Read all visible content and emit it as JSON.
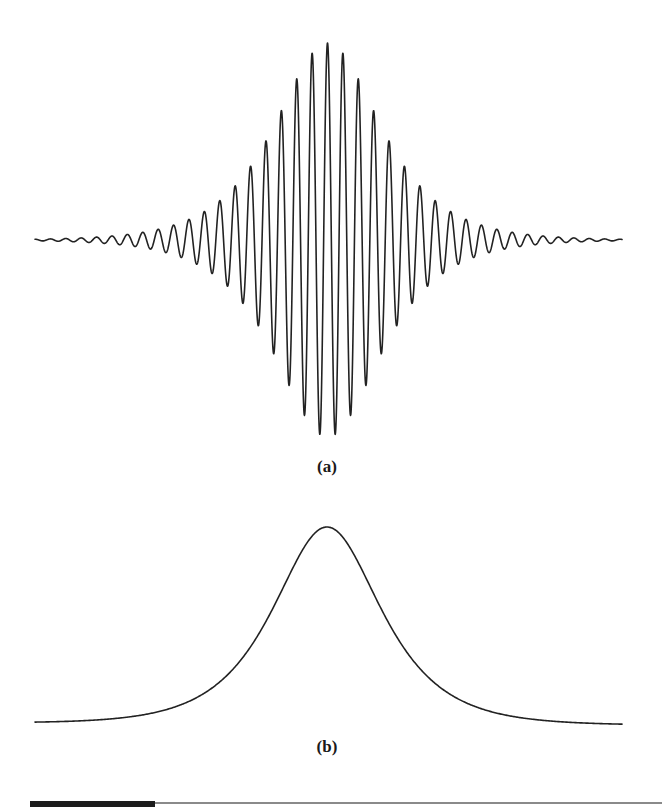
{
  "figure": {
    "panels": [
      {
        "id": "a",
        "label": "(a)"
      },
      {
        "id": "b",
        "label": "(b)"
      }
    ],
    "colors": {
      "line": "#222222",
      "background": "#ffffff",
      "rule_thick": "#1c1c1c",
      "rule_thin": "#8a8a8a"
    }
  },
  "chart_data": [
    {
      "type": "line",
      "title": "",
      "panel_label": "(a)",
      "description": "Oscillating wave packet: cosine carrier under a symmetric sech-shaped envelope, peak at center",
      "xlabel": "",
      "ylabel": "",
      "axes_visible": false,
      "grid": false,
      "legend": null,
      "model": {
        "form": "A * sech((x - x0)/w) * cos(2*pi*(x - x0)/period)",
        "x_start_px": 35,
        "x_end_px": 622,
        "x0_px": 327.5,
        "baseline_y_px": 240,
        "amplitude_px": 197,
        "period_px": 15.4,
        "envelope_width_px": 47
      },
      "peaks": {
        "offset_periods": [
          0,
          1,
          2,
          3,
          4,
          5,
          6,
          7,
          8,
          9,
          10
        ],
        "relative_amplitude": [
          1.0,
          0.95,
          0.83,
          0.675,
          0.52,
          0.39,
          0.29,
          0.22,
          0.16,
          0.117,
          0.086
        ]
      }
    },
    {
      "type": "line",
      "title": "",
      "panel_label": "(b)",
      "description": "Envelope of the wave packet: single symmetric bell-shaped (sech) pulse",
      "xlabel": "",
      "ylabel": "",
      "axes_visible": false,
      "grid": false,
      "legend": null,
      "model": {
        "form": "A * sech((x - x0)/w)",
        "x_start_px": 35,
        "x_end_px": 622,
        "x0_px": 327,
        "baseline_y_left_px": 723,
        "baseline_y_right_px": 725,
        "amplitude_px": 197,
        "envelope_width_px": 48
      },
      "samples": {
        "x_offset_px": [
          0,
          50,
          107,
          177,
          292
        ],
        "relative_height": [
          1.0,
          0.635,
          0.22,
          0.052,
          0.0
        ]
      }
    }
  ]
}
